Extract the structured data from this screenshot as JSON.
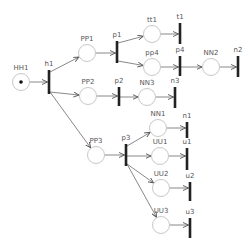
{
  "diagram": {
    "type": "petri-net",
    "colors": {
      "place_stroke": "#c8c8c8",
      "transition": "#222222",
      "arc": "#6a6a6a",
      "label": "#555555"
    },
    "places": [
      {
        "id": "HH1",
        "label": "HH1",
        "x": 21,
        "y": 82,
        "tokens": 1
      },
      {
        "id": "PP1",
        "label": "PP1",
        "x": 87,
        "y": 53,
        "tokens": 0
      },
      {
        "id": "PP2",
        "label": "PP2",
        "x": 88,
        "y": 96,
        "tokens": 0
      },
      {
        "id": "PP3",
        "label": "PP3",
        "x": 96,
        "y": 155,
        "tokens": 0
      },
      {
        "id": "tt1",
        "label": "tt1",
        "x": 152,
        "y": 34,
        "tokens": 0
      },
      {
        "id": "pp4",
        "label": "pp4",
        "x": 152,
        "y": 67,
        "tokens": 0
      },
      {
        "id": "NN2",
        "label": "NN2",
        "x": 211,
        "y": 67,
        "tokens": 0
      },
      {
        "id": "NN3",
        "label": "NN3",
        "x": 147,
        "y": 97,
        "tokens": 0
      },
      {
        "id": "NN1",
        "label": "NN1",
        "x": 158,
        "y": 128,
        "tokens": 0
      },
      {
        "id": "UU1",
        "label": "UU1",
        "x": 160,
        "y": 156,
        "tokens": 0
      },
      {
        "id": "UU2",
        "label": "UU2",
        "x": 161,
        "y": 188,
        "tokens": 0
      },
      {
        "id": "UU3",
        "label": "UU3",
        "x": 161,
        "y": 225,
        "tokens": 0
      }
    ],
    "transitions": [
      {
        "id": "h1",
        "label": "h1",
        "x": 49,
        "y1": 70,
        "y2": 94
      },
      {
        "id": "p1",
        "label": "p1",
        "x": 117,
        "y1": 41,
        "y2": 63
      },
      {
        "id": "p2",
        "label": "p2",
        "x": 119,
        "y1": 87,
        "y2": 106
      },
      {
        "id": "p3",
        "label": "p3",
        "x": 126,
        "y1": 144,
        "y2": 166
      },
      {
        "id": "t1",
        "label": "t1",
        "x": 180,
        "y1": 23,
        "y2": 44
      },
      {
        "id": "p4",
        "label": "p4",
        "x": 180,
        "y1": 56,
        "y2": 76
      },
      {
        "id": "n2",
        "label": "n2",
        "x": 238,
        "y1": 56,
        "y2": 77
      },
      {
        "id": "n3",
        "label": "n3",
        "x": 175,
        "y1": 87,
        "y2": 108
      },
      {
        "id": "n1",
        "label": "n1",
        "x": 187,
        "y1": 122,
        "y2": 138
      },
      {
        "id": "u1",
        "label": "u1",
        "x": 187,
        "y1": 148,
        "y2": 170
      },
      {
        "id": "u2",
        "label": "u2",
        "x": 190,
        "y1": 182,
        "y2": 201
      },
      {
        "id": "u3",
        "label": "u3",
        "x": 190,
        "y1": 218,
        "y2": 238
      }
    ],
    "arcs": [
      [
        "HH1",
        "h1"
      ],
      [
        "h1",
        "PP1"
      ],
      [
        "h1",
        "PP2"
      ],
      [
        "h1",
        "PP3"
      ],
      [
        "PP1",
        "p1"
      ],
      [
        "p1",
        "tt1"
      ],
      [
        "p1",
        "pp4"
      ],
      [
        "tt1",
        "t1"
      ],
      [
        "pp4",
        "p4"
      ],
      [
        "p4",
        "NN2"
      ],
      [
        "NN2",
        "n2"
      ],
      [
        "PP2",
        "p2"
      ],
      [
        "p2",
        "NN3"
      ],
      [
        "NN3",
        "n3"
      ],
      [
        "PP3",
        "p3"
      ],
      [
        "p3",
        "NN1"
      ],
      [
        "p3",
        "UU1"
      ],
      [
        "p3",
        "UU2"
      ],
      [
        "p3",
        "UU3"
      ],
      [
        "NN1",
        "n1"
      ],
      [
        "UU1",
        "u1"
      ],
      [
        "UU2",
        "u2"
      ],
      [
        "UU3",
        "u3"
      ]
    ]
  }
}
